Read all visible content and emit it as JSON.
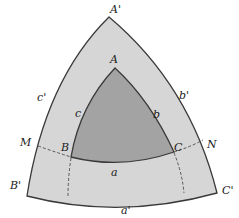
{
  "diagram": {
    "colors": {
      "background": "#ffffff",
      "outer_fill": "#d6d6d6",
      "inner_fill": "#a3a3a3",
      "stroke": "#3a3a3a"
    },
    "vertices": {
      "outer_top": "A'",
      "outer_left": "B'",
      "outer_right": "C'",
      "inner_top": "A",
      "inner_left": "B",
      "inner_right": "C"
    },
    "sides": {
      "outer_bottom": "a'",
      "outer_right": "b'",
      "outer_left": "c'",
      "inner_bottom": "a",
      "inner_right": "b",
      "inner_left": "c"
    },
    "points": {
      "left": "M",
      "right": "N"
    }
  }
}
